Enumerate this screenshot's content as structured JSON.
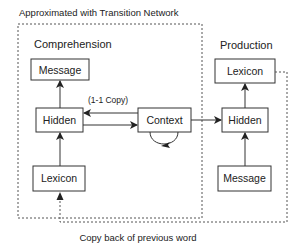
{
  "title": "Approximated with Transition Network",
  "caption": "Copy back of previous word",
  "comprehension": {
    "label": "Comprehension",
    "message": "Message",
    "hidden": "Hidden",
    "lexicon": "Lexicon",
    "context": "Context",
    "copy_label": "(1-1 Copy)"
  },
  "production": {
    "label": "Production",
    "lexicon": "Lexicon",
    "hidden": "Hidden",
    "message": "Message"
  },
  "colors": {
    "stroke": "#333333",
    "dotted": "#555555",
    "text": "#222222"
  }
}
